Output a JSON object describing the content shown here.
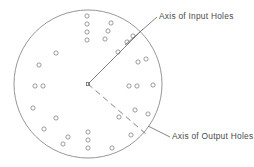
{
  "figure": {
    "background_color": "#ffffff",
    "line_color": "#8a8a8a",
    "text_color": "#4a4a4a"
  },
  "annotations": {
    "input_axis_label": "Axis of Input Holes",
    "output_axis_label": "Axis of Output Holes"
  },
  "chart_data": {
    "type": "scatter",
    "xlabel": "",
    "ylabel": "",
    "xlim": [
      0,
      254
    ],
    "ylim": [
      0,
      167
    ],
    "grid": false,
    "legend": "none",
    "disc": {
      "center_x": 88,
      "center_y": 84,
      "radius": 74,
      "stroke": "#8a8a8a"
    },
    "center_marker": {
      "x": 88,
      "y": 84,
      "size": 3.2
    },
    "input_axis": {
      "label": "Axis of Input Holes",
      "style": "solid",
      "from_x": 88,
      "from_y": 84,
      "to_x": 143,
      "to_y": 29
    },
    "output_axis": {
      "label": "Axis of Output Holes",
      "style": "dashed",
      "from_x": 88,
      "from_y": 84,
      "to_x": 146,
      "to_y": 134
    },
    "input_leader": {
      "from_x": 157,
      "from_y": 17,
      "to_x": 125,
      "to_y": 45
    },
    "output_leader": {
      "from_x": 170,
      "from_y": 137,
      "to_x": 148,
      "to_y": 126
    },
    "input_label_pos": {
      "x": 159,
      "y": 17
    },
    "output_label_pos": {
      "x": 172,
      "y": 137
    },
    "hole_radius": 2.1,
    "holes": [
      {
        "x": 87,
        "y": 16
      },
      {
        "x": 87,
        "y": 24
      },
      {
        "x": 87,
        "y": 32
      },
      {
        "x": 87,
        "y": 40
      },
      {
        "x": 111,
        "y": 23
      },
      {
        "x": 108,
        "y": 31
      },
      {
        "x": 105,
        "y": 39
      },
      {
        "x": 133,
        "y": 36
      },
      {
        "x": 127,
        "y": 42
      },
      {
        "x": 118,
        "y": 52
      },
      {
        "x": 138,
        "y": 62
      },
      {
        "x": 146,
        "y": 59
      },
      {
        "x": 129,
        "y": 86
      },
      {
        "x": 137,
        "y": 86
      },
      {
        "x": 153,
        "y": 85
      },
      {
        "x": 56,
        "y": 53
      },
      {
        "x": 39,
        "y": 65
      },
      {
        "x": 35,
        "y": 86
      },
      {
        "x": 43,
        "y": 86
      },
      {
        "x": 33,
        "y": 108
      },
      {
        "x": 56,
        "y": 118
      },
      {
        "x": 44,
        "y": 129
      },
      {
        "x": 68,
        "y": 137
      },
      {
        "x": 63,
        "y": 144
      },
      {
        "x": 88,
        "y": 132
      },
      {
        "x": 88,
        "y": 140
      },
      {
        "x": 88,
        "y": 148
      },
      {
        "x": 112,
        "y": 148
      },
      {
        "x": 119,
        "y": 117
      },
      {
        "x": 135,
        "y": 110
      },
      {
        "x": 148,
        "y": 114
      },
      {
        "x": 131,
        "y": 135
      }
    ]
  }
}
